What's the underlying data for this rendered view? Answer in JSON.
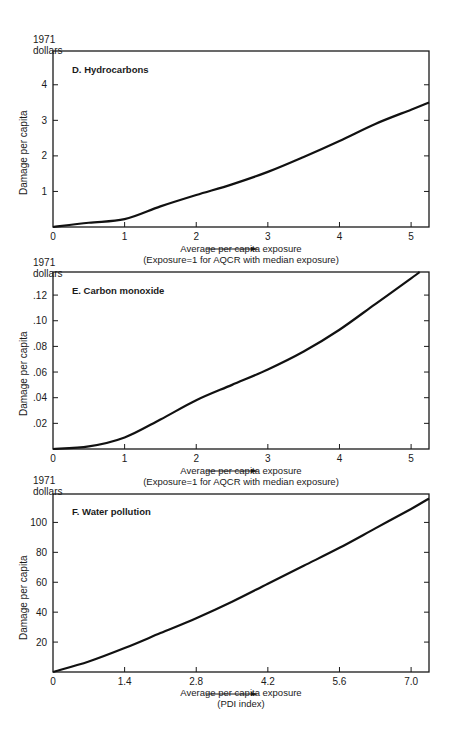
{
  "chart_data": [
    {
      "type": "line",
      "title": "D.  Hydrocarbons",
      "unit_label": [
        "1971",
        "dollars"
      ],
      "ylabel": "Damage per capita",
      "xlabel": "Average per capita exposure",
      "xlabel_note": "(Exposure=1 for AQCR with median exposure)",
      "x_ticks": [
        "0",
        "1",
        "2",
        "3",
        "4",
        "5"
      ],
      "y_ticks": [
        "1",
        "2",
        "3",
        "4"
      ],
      "xlim": [
        0,
        5.25
      ],
      "ylim": [
        0,
        4.95
      ],
      "grid": false,
      "x": [
        0,
        0.5,
        1.0,
        1.5,
        2.0,
        2.5,
        3.0,
        3.5,
        4.0,
        4.5,
        5.0,
        5.25
      ],
      "values": [
        0,
        0.12,
        0.22,
        0.58,
        0.9,
        1.2,
        1.55,
        1.97,
        2.42,
        2.9,
        3.3,
        3.5
      ]
    },
    {
      "type": "line",
      "title": "E.  Carbon monoxide",
      "unit_label": [
        "1971",
        "dollars"
      ],
      "ylabel": "Damage per capita",
      "xlabel": "Average per capita exposure",
      "xlabel_note": "(Exposure=1 for AQCR with median exposure)",
      "x_ticks": [
        "0",
        "1",
        "2",
        "3",
        "4",
        "5"
      ],
      "y_ticks": [
        ".02",
        ".04",
        ".06",
        ".08",
        ".10",
        ".12"
      ],
      "xlim": [
        0,
        5.25
      ],
      "ylim": [
        0,
        0.138
      ],
      "grid": false,
      "x": [
        0,
        0.5,
        1.0,
        1.5,
        2.0,
        2.5,
        3.0,
        3.5,
        4.0,
        4.5,
        5.0,
        5.12
      ],
      "values": [
        0,
        0.002,
        0.009,
        0.023,
        0.038,
        0.05,
        0.062,
        0.076,
        0.093,
        0.113,
        0.133,
        0.138
      ]
    },
    {
      "type": "line",
      "title": "F.  Water pollution",
      "unit_label": [
        "1971",
        "dollars"
      ],
      "ylabel": "Damage per capita",
      "xlabel": "Average per capita exposure",
      "xlabel_note": "(PDI index)",
      "x_ticks": [
        "0",
        "1.4",
        "2.8",
        "4.2",
        "5.6",
        "7.0"
      ],
      "y_ticks": [
        "20",
        "40",
        "60",
        "80",
        "100"
      ],
      "xlim": [
        0,
        7.35
      ],
      "ylim": [
        0,
        119
      ],
      "grid": false,
      "x": [
        0,
        0.7,
        1.4,
        2.1,
        2.8,
        3.5,
        4.2,
        4.9,
        5.6,
        6.3,
        7.0,
        7.35
      ],
      "values": [
        0,
        7,
        16,
        26,
        36,
        47,
        59,
        71,
        83,
        96,
        109,
        116
      ]
    }
  ]
}
